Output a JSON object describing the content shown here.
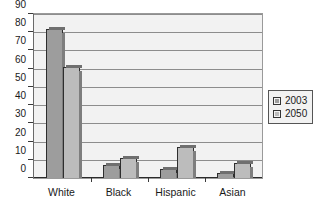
{
  "chart_data": {
    "type": "bar",
    "title": "",
    "subtitle": "",
    "xlabel": "",
    "ylabel": "",
    "categories": [
      "White",
      "Black",
      "Hispanic",
      "Asian"
    ],
    "series": [
      {
        "name": "2003",
        "color": "#9d9d9d",
        "values": [
          82,
          7,
          5,
          3
        ]
      },
      {
        "name": "2050",
        "color": "#bcbcbc",
        "values": [
          61,
          11,
          17,
          8
        ]
      }
    ],
    "ylim": [
      0,
      90
    ],
    "ytick_step": 10,
    "yticks": [
      90,
      80,
      70,
      60,
      50,
      40,
      30,
      20,
      10,
      0
    ],
    "ytick_labels": [
      "90",
      "80",
      "70",
      "60",
      "50",
      "40",
      "30",
      "20",
      "10",
      "0"
    ],
    "grid": true,
    "grid_axis": "y",
    "legend_position": "right",
    "legend_entries": [
      "2003",
      "2050"
    ],
    "annotations": []
  },
  "legend": {
    "items": [
      {
        "label": "2003",
        "color": "#9d9d9d"
      },
      {
        "label": "2050",
        "color": "#bcbcbc"
      }
    ]
  },
  "colors": {
    "series_2003": "#9d9d9d",
    "series_2050": "#bcbcbc",
    "plot_background": "#f2f2f2",
    "gridline": "#8d8d8d",
    "axis": "#2b2b2b",
    "text": "#1a1a1a"
  }
}
